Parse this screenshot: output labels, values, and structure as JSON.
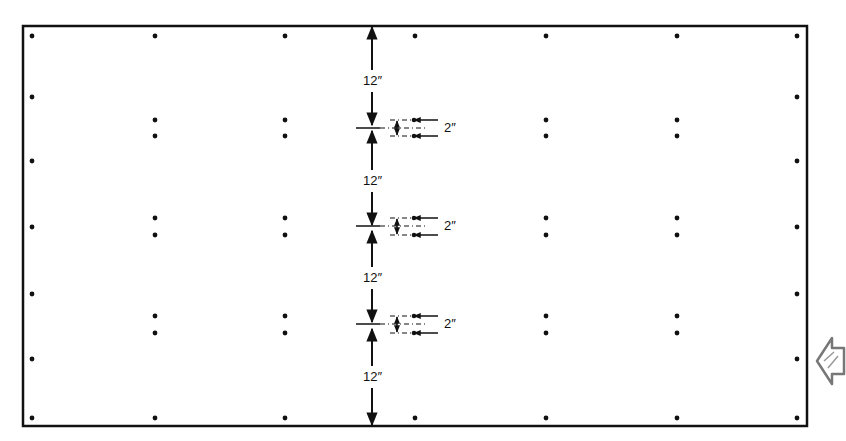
{
  "diagram": {
    "title": "",
    "stroke_color": "#111111",
    "background": "#ffffff",
    "border": {
      "left": 23,
      "top": 26,
      "right": 807,
      "bottom": 426
    },
    "vertical_dimensions": [
      {
        "label": "12″",
        "from_y": 26,
        "to_y": 126,
        "label_y": 80
      },
      {
        "label": "12″",
        "from_y": 130,
        "to_y": 226,
        "label_y": 180
      },
      {
        "label": "12″",
        "from_y": 230,
        "to_y": 323,
        "label_y": 277
      },
      {
        "label": "12″",
        "from_y": 328,
        "to_y": 426,
        "label_y": 376
      }
    ],
    "spacing_callouts": [
      {
        "label": "2″",
        "y_top": 120,
        "y_bottom": 136,
        "center_y": 128
      },
      {
        "label": "2″",
        "y_top": 218,
        "y_bottom": 235,
        "center_y": 226
      },
      {
        "label": "2″",
        "y_top": 316,
        "y_bottom": 333,
        "center_y": 324
      }
    ],
    "dimension_line_x": 372,
    "edge_dots": {
      "left_x": 32,
      "right_x": 797,
      "ys": [
        36,
        97,
        161,
        227,
        294,
        359,
        418
      ]
    },
    "top_bottom_dots": {
      "xs": [
        155,
        285,
        415,
        546,
        677
      ],
      "top_y": 36,
      "bottom_y": 418
    },
    "interior_pair_columns": [
      155,
      285,
      546,
      677
    ],
    "interior_pair_rows": [
      [
        120,
        136
      ],
      [
        218,
        235
      ],
      [
        316,
        333
      ]
    ],
    "nav_icon": "next-page-arrow-icon"
  }
}
